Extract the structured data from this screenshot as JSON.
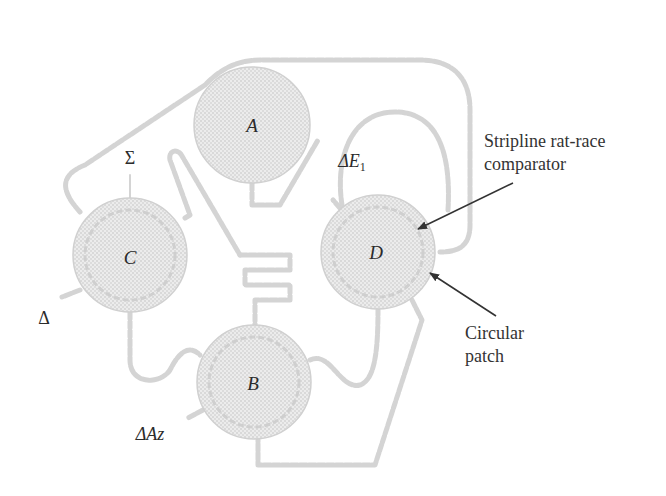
{
  "diagram": {
    "type": "monopulse patch antenna feed network",
    "colors": {
      "background": "#ffffff",
      "patch_fill": "#e6e6e6",
      "patch_dots": "#c4c4c4",
      "trace": "#d6d6d6",
      "text": "#2b2b2b",
      "arrow": "#333333"
    },
    "patches": [
      {
        "id": "A",
        "label": "A",
        "cx": 252,
        "cy": 125,
        "r": 58
      },
      {
        "id": "C",
        "label": "C",
        "cx": 130,
        "cy": 255,
        "r": 57
      },
      {
        "id": "D",
        "label": "D",
        "cx": 378,
        "cy": 252,
        "r": 57
      },
      {
        "id": "B",
        "label": "B",
        "cx": 254,
        "cy": 382,
        "r": 57
      }
    ],
    "ports": {
      "sum": {
        "symbol": "Σ",
        "x": 130,
        "y": 158
      },
      "delta_el": {
        "symbol": "ΔE",
        "subscript": "1",
        "x": 352,
        "y": 161
      },
      "delta": {
        "symbol": "Δ",
        "x": 44,
        "y": 318
      },
      "delta_az": {
        "symbol": "ΔAz",
        "x": 150,
        "y": 434
      }
    },
    "callouts": {
      "comparator": {
        "line1": "Stripline rat-race",
        "line2": "comparator",
        "x": 484,
        "y": 130
      },
      "patch": {
        "line1": "Circular",
        "line2": "patch",
        "x": 465,
        "y": 322
      }
    }
  }
}
